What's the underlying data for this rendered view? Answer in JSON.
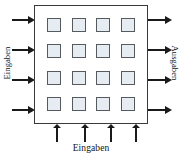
{
  "diagram": {
    "box": {
      "name": "process-block",
      "fill": "#ffffff",
      "border_color": "#3a3a3a"
    },
    "cell": {
      "fill": "#e6ecf1",
      "border_color": "#555a5e",
      "rows": 4,
      "columns": 4,
      "count": 16
    },
    "labels": {
      "left": "Eingaben",
      "right": "Ausgaben",
      "bottom": "Eingaben"
    },
    "arrows": {
      "color": "#1a1a1a",
      "left": {
        "count": 4,
        "direction": "right",
        "meaning": "Eingaben"
      },
      "right": {
        "count": 4,
        "direction": "right",
        "meaning": "Ausgaben"
      },
      "bottom": {
        "count": 4,
        "direction": "up",
        "meaning": "Eingaben"
      }
    }
  }
}
